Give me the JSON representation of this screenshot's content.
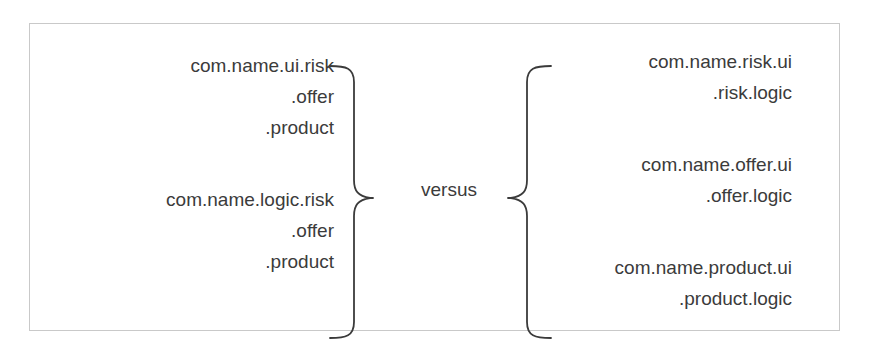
{
  "diagram": {
    "left_column": {
      "groups": [
        {
          "lines": [
            "com.name.ui.risk",
            ".offer",
            ".product"
          ]
        },
        {
          "lines": [
            "com.name.logic.risk",
            ".offer",
            ".product"
          ]
        }
      ]
    },
    "separator": {
      "label": "versus",
      "left_brace": "right-facing-curly-brace",
      "right_brace": "left-facing-curly-brace"
    },
    "right_column": {
      "groups": [
        {
          "lines": [
            "com.name.risk.ui",
            ".risk.logic"
          ]
        },
        {
          "lines": [
            "com.name.offer.ui",
            ".offer.logic"
          ]
        },
        {
          "lines": [
            "com.name.product.ui",
            ".product.logic"
          ]
        }
      ]
    },
    "colors": {
      "text": "#3b3b3b",
      "border": "#c9c9c9",
      "background": "#ffffff",
      "brace_stroke": "#3b3b3b"
    }
  }
}
